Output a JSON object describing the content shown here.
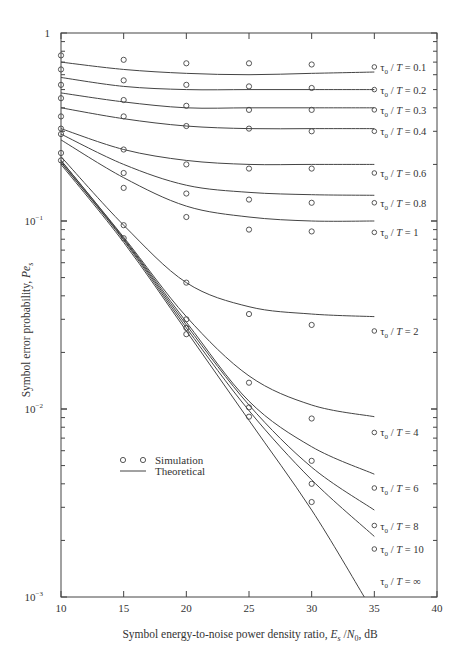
{
  "chart_data": {
    "type": "line",
    "title": "",
    "xlabel": "Symbol energy-to-noise power density ratio, E_s/N_0, dB",
    "ylabel": "Symbol error probability, Pe_s",
    "xlim": [
      10,
      40
    ],
    "ylim": [
      0.001,
      1
    ],
    "yscale": "log",
    "x_ticks": [
      10,
      15,
      20,
      25,
      30,
      35,
      40
    ],
    "y_ticks": [
      "1",
      "10^-1",
      "10^-2",
      "10^-3"
    ],
    "grid": false,
    "legend": {
      "position": "lower-left",
      "entries": [
        {
          "marker": "o  o",
          "label": "Simulation"
        },
        {
          "marker": "line",
          "label": "Theoretical"
        }
      ]
    },
    "theoretical": [
      {
        "name": "τ0 / T = 0.1",
        "x": [
          10,
          15,
          20,
          25,
          30,
          35
        ],
        "values": [
          0.7,
          0.64,
          0.61,
          0.6,
          0.61,
          0.62
        ]
      },
      {
        "name": "τ0 / T = 0.2",
        "x": [
          10,
          15,
          20,
          25,
          30,
          35
        ],
        "values": [
          0.58,
          0.52,
          0.5,
          0.5,
          0.5,
          0.5
        ]
      },
      {
        "name": "τ0 / T = 0.3",
        "x": [
          10,
          15,
          20,
          25,
          30,
          35
        ],
        "values": [
          0.48,
          0.43,
          0.4,
          0.4,
          0.4,
          0.4
        ]
      },
      {
        "name": "τ0 / T = 0.4",
        "x": [
          10,
          15,
          20,
          25,
          30,
          35
        ],
        "values": [
          0.4,
          0.35,
          0.32,
          0.31,
          0.31,
          0.31
        ]
      },
      {
        "name": "τ0 / T = 0.6",
        "x": [
          10,
          15,
          20,
          25,
          30,
          35
        ],
        "values": [
          0.31,
          0.24,
          0.21,
          0.2,
          0.2,
          0.2
        ]
      },
      {
        "name": "τ0 / T = 0.8",
        "x": [
          10,
          15,
          20,
          25,
          30,
          35
        ],
        "values": [
          0.29,
          0.2,
          0.155,
          0.142,
          0.138,
          0.137
        ]
      },
      {
        "name": "τ0 / T = 1",
        "x": [
          10,
          15,
          20,
          25,
          30,
          35
        ],
        "values": [
          0.27,
          0.17,
          0.12,
          0.105,
          0.1,
          0.1
        ]
      },
      {
        "name": "τ0 / T = 2",
        "x": [
          10,
          15,
          20,
          25,
          30,
          35
        ],
        "values": [
          0.22,
          0.095,
          0.047,
          0.035,
          0.032,
          0.031
        ]
      },
      {
        "name": "τ0 / T = 4",
        "x": [
          10,
          15,
          20,
          25,
          30,
          35
        ],
        "values": [
          0.21,
          0.082,
          0.031,
          0.015,
          0.0105,
          0.0091
        ]
      },
      {
        "name": "τ0 / T = 6",
        "x": [
          10,
          15,
          20,
          25,
          30,
          35
        ],
        "values": [
          0.21,
          0.081,
          0.029,
          0.011,
          0.0063,
          0.0045
        ]
      },
      {
        "name": "τ0 / T = 8",
        "x": [
          10,
          15,
          20,
          25,
          30,
          35
        ],
        "values": [
          0.205,
          0.08,
          0.028,
          0.0105,
          0.0049,
          0.0029
        ]
      },
      {
        "name": "τ0 / T = 10",
        "x": [
          10,
          15,
          20,
          25,
          30,
          35
        ],
        "values": [
          0.205,
          0.079,
          0.027,
          0.0098,
          0.0042,
          0.0021
        ]
      },
      {
        "name": "τ0 / T = ∞",
        "x": [
          10,
          15,
          20,
          25,
          30,
          34.2
        ],
        "values": [
          0.2,
          0.077,
          0.026,
          0.0087,
          0.0029,
          0.001
        ]
      }
    ],
    "simulation": [
      {
        "name": "τ0 / T = 0.1",
        "x": [
          10,
          15,
          20,
          25,
          30,
          35
        ],
        "values": [
          0.76,
          0.72,
          0.69,
          0.69,
          0.68,
          0.66
        ]
      },
      {
        "name": "τ0 / T = 0.2",
        "x": [
          10,
          15,
          20,
          25,
          30,
          35
        ],
        "values": [
          0.64,
          0.56,
          0.53,
          0.52,
          0.51,
          0.5
        ]
      },
      {
        "name": "τ0 / T = 0.3",
        "x": [
          10,
          15,
          20,
          25,
          30,
          35
        ],
        "values": [
          0.53,
          0.44,
          0.41,
          0.39,
          0.39,
          0.39
        ]
      },
      {
        "name": "τ0 / T = 0.4",
        "x": [
          10,
          15,
          20,
          25,
          30,
          35
        ],
        "values": [
          0.45,
          0.36,
          0.32,
          0.31,
          0.3,
          0.3
        ]
      },
      {
        "name": "τ0 / T = 0.6",
        "x": [
          10,
          15,
          20,
          25,
          30,
          35
        ],
        "values": [
          0.36,
          0.24,
          0.2,
          0.19,
          0.19,
          0.18
        ]
      },
      {
        "name": "τ0 / T = 0.8",
        "x": [
          10,
          15,
          20,
          25,
          30,
          35
        ],
        "values": [
          0.31,
          0.18,
          0.14,
          0.13,
          0.125,
          0.125
        ]
      },
      {
        "name": "τ0 / T = 1",
        "x": [
          10,
          15,
          20,
          25,
          30,
          35
        ],
        "values": [
          0.29,
          0.15,
          0.105,
          0.09,
          0.088,
          0.087
        ]
      },
      {
        "name": "τ0 / T = 2",
        "x": [
          10,
          15,
          20,
          25,
          30,
          35
        ],
        "values": [
          0.23,
          0.095,
          0.047,
          0.032,
          0.028,
          0.026
        ]
      },
      {
        "name": "τ0 / T = 4",
        "x": [
          10,
          15,
          20,
          25,
          30,
          35
        ],
        "values": [
          0.21,
          0.081,
          0.03,
          0.0138,
          0.0089,
          0.0075
        ]
      },
      {
        "name": "τ0 / T = 6",
        "x": [
          20,
          25,
          30,
          35
        ],
        "values": [
          0.027,
          0.0102,
          0.0053,
          0.0038
        ]
      },
      {
        "name": "τ0 / T = 8",
        "x": [
          20,
          25,
          30,
          35
        ],
        "values": [
          0.025,
          0.0091,
          0.004,
          0.0024
        ]
      },
      {
        "name": "τ0 / T = 10",
        "x": [
          30,
          35
        ],
        "values": [
          0.0032,
          0.0018
        ]
      }
    ],
    "curve_labels": [
      {
        "text": "τ0 / T = 0.1",
        "y_value": 0.66,
        "marker": true
      },
      {
        "text": "τ0 / T = 0.2",
        "y_value": 0.5,
        "marker": true
      },
      {
        "text": "τ0 / T = 0.3",
        "y_value": 0.39,
        "marker": true
      },
      {
        "text": "τ0 / T = 0.4",
        "y_value": 0.3,
        "marker": true
      },
      {
        "text": "τ0 / T = 0.6",
        "y_value": 0.18,
        "marker": true
      },
      {
        "text": "τ0 / T = 0.8",
        "y_value": 0.125,
        "marker": true
      },
      {
        "text": "τ0 / T = 1",
        "y_value": 0.087,
        "marker": true
      },
      {
        "text": "τ0 / T = 2",
        "y_value": 0.026,
        "marker": true
      },
      {
        "text": "τ0 / T = 4",
        "y_value": 0.0075,
        "marker": true
      },
      {
        "text": "τ0 / T = 6",
        "y_value": 0.0038,
        "marker": true
      },
      {
        "text": "τ0 / T = 8",
        "y_value": 0.0024,
        "marker": true
      },
      {
        "text": "τ0 / T = 10",
        "y_value": 0.0018,
        "marker": true
      },
      {
        "text": "τ0 / T = ∞",
        "y_value": 0.00122,
        "marker": false
      }
    ]
  },
  "axis_text": {
    "y_tick_1": "1",
    "y_tick_m1": "10",
    "y_tick_m1_exp": "−1",
    "y_tick_m2": "10",
    "y_tick_m2_exp": "−2",
    "y_tick_m3": "10",
    "y_tick_m3_exp": "−3",
    "xlabel_main": "Symbol energy-to-noise power density ratio, ",
    "xlabel_E": "E",
    "xlabel_s": "s",
    "xlabel_slash": " /",
    "xlabel_N": "N",
    "xlabel_0": "0",
    "xlabel_unit": ", dB",
    "ylabel_main": "Symbol error probability, ",
    "ylabel_Pe": "Pe",
    "ylabel_s": "s"
  },
  "legend": {
    "simulation": "Simulation",
    "theoretical": "Theoretical"
  },
  "layout": {
    "plot_left": 61,
    "plot_right": 437,
    "plot_top": 33,
    "plot_bottom": 597,
    "line_color": "#444444",
    "text_color": "#333333"
  }
}
